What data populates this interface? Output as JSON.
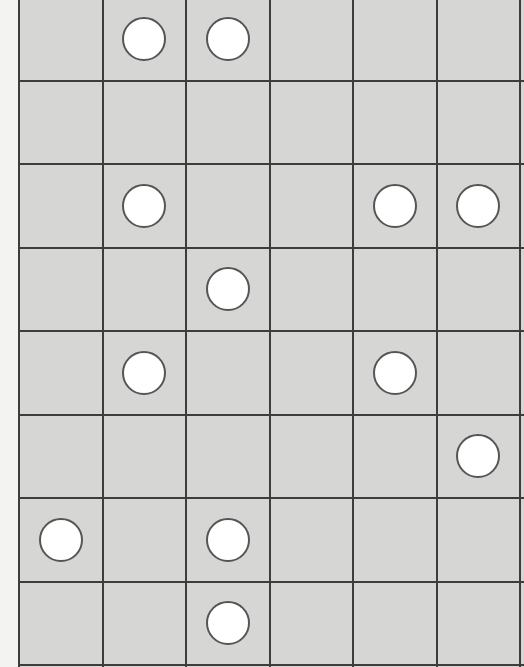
{
  "board": {
    "columns": 6,
    "rows": 8,
    "cell_width": 83.5,
    "cell_height": 83.5,
    "colors": {
      "background": "#d6d6d5",
      "grid_line": "#3d3d3d",
      "piece_fill": "#ffffff",
      "piece_border": "#555555",
      "margin": "#f3f3f1"
    },
    "pieces": [
      {
        "row": 0,
        "col": 1
      },
      {
        "row": 0,
        "col": 2
      },
      {
        "row": 2,
        "col": 1
      },
      {
        "row": 2,
        "col": 4
      },
      {
        "row": 2,
        "col": 5
      },
      {
        "row": 3,
        "col": 2
      },
      {
        "row": 4,
        "col": 1
      },
      {
        "row": 4,
        "col": 4
      },
      {
        "row": 5,
        "col": 5
      },
      {
        "row": 6,
        "col": 0
      },
      {
        "row": 6,
        "col": 2
      },
      {
        "row": 7,
        "col": 2
      }
    ]
  }
}
